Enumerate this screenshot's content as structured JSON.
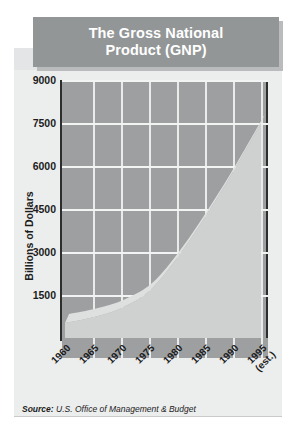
{
  "title": {
    "line1": "The Gross National",
    "line2": "Product (GNP)"
  },
  "source": {
    "label": "Source:",
    "text": " U.S. Office of Management & Budget"
  },
  "colors": {
    "banner": "#939697",
    "banner_shadow": "#b9bbbc",
    "plot_background": "#9d9fa0",
    "area_fill": "#cfd0d0",
    "area_top_face": "#dedfdf",
    "gridline": "#f2f3f3",
    "axis": "#2d2d2d",
    "panel": "#eceded",
    "text": "#1c1c1c"
  },
  "chart_data": {
    "type": "area",
    "title": "The Gross National Product (GNP)",
    "xlabel": "",
    "ylabel": "Billions of Dollars",
    "categories": [
      "1960",
      "1965",
      "1970",
      "1975",
      "1980",
      "1985",
      "1990",
      "1995"
    ],
    "x_tick_labels": [
      "1960",
      "1965",
      "1970",
      "1975",
      "1980",
      "1985",
      "1990",
      "1995\n(est.)"
    ],
    "last_category_note": "(est.)",
    "values": [
      520,
      720,
      1040,
      1630,
      2790,
      4220,
      5800,
      7500
    ],
    "y_tick_labels": [
      "1500",
      "3000",
      "4500",
      "6000",
      "7500",
      "9000"
    ],
    "y_ticks": [
      1500,
      3000,
      4500,
      6000,
      7500,
      9000
    ],
    "ylim": [
      0,
      9000
    ],
    "grid": "horizontal-and-vertical",
    "legend": "none",
    "series": [
      {
        "name": "GNP",
        "values": [
          520,
          720,
          1040,
          1630,
          2790,
          4220,
          5800,
          7500
        ]
      }
    ],
    "units": "Billions of Dollars"
  }
}
